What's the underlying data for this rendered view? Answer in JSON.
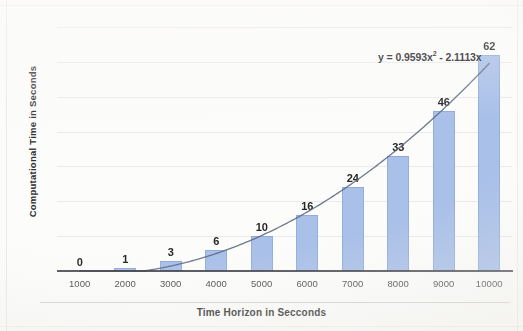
{
  "chart_data": {
    "type": "bar",
    "title": "",
    "subtitle": "",
    "xlabel": "Time Horizon in Secconds",
    "ylabel": "Computational Time in Seconds",
    "categories": [
      "1000",
      "2000",
      "3000",
      "4000",
      "5000",
      "6000",
      "7000",
      "8000",
      "9000",
      "10000"
    ],
    "values": [
      0,
      1,
      3,
      6,
      10,
      16,
      24,
      33,
      46,
      62
    ],
    "data_labels": [
      "0",
      "1",
      "3",
      "6",
      "10",
      "16",
      "24",
      "33",
      "46",
      "62"
    ],
    "series": [
      {
        "name": "Computational Time",
        "values": [
          0,
          1,
          3,
          6,
          10,
          16,
          24,
          33,
          46,
          62
        ],
        "color": "#a9c0e8"
      }
    ],
    "trendline": {
      "type": "polynomial",
      "order": 2,
      "equation": "y = 0.9593x",
      "equation_exponent": "2",
      "equation_tail": " - 2.1113x",
      "equation_full": "y = 0.9593x² - 2.1113x",
      "coefficients": [
        0.9593,
        -2.1113,
        0
      ],
      "color": "#5f6c85"
    },
    "ylim": [
      0,
      70
    ],
    "xlim": [
      "1000",
      "10000"
    ],
    "gridlines": {
      "horizontal": true,
      "vertical": false,
      "y_values": [
        10,
        20,
        30,
        40,
        50,
        60,
        70
      ],
      "color": "#dedede"
    },
    "legend": {
      "visible": false,
      "position": "none"
    },
    "axis_tick_labels_x": [
      "1000",
      "2000",
      "3000",
      "4000",
      "5000",
      "6000",
      "7000",
      "8000",
      "9000",
      "10000"
    ],
    "axis_tick_labels_y": []
  },
  "colors": {
    "bar_fill": "#a9c0e8",
    "bar_edge": "#93aedd",
    "trendline": "#5f6c85",
    "axis": "#3c3c46",
    "grid": "#dedede",
    "text": "#262626",
    "background": "#fcfcfb"
  }
}
